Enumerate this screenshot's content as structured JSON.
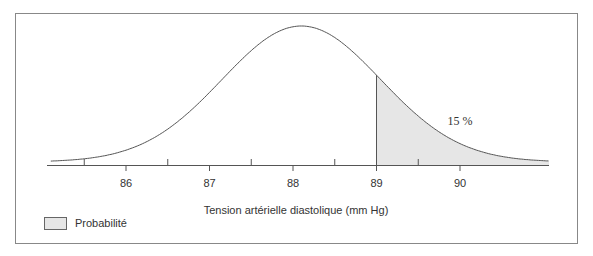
{
  "chart_data": {
    "type": "area",
    "title": "",
    "xlabel": "Tension artérielle diastolique (mm Hg)",
    "ylabel": "",
    "distribution": "normal",
    "mean": 88.1,
    "sd": 0.95,
    "xlim": [
      85.1,
      91.1
    ],
    "major_ticks": [
      86,
      87,
      88,
      89,
      90
    ],
    "minor_ticks": [
      85.5,
      86.5,
      87.5,
      88.5,
      89.5
    ],
    "tick_labels": [
      "86",
      "87",
      "88",
      "89",
      "90"
    ],
    "shaded_region": {
      "from": 89,
      "to": 91.1,
      "label": "15 %",
      "probability": 0.15
    },
    "legend": [
      {
        "label": "Probabilité",
        "color": "#e6e6e6"
      }
    ],
    "grid": false,
    "legend_position": "bottom-left"
  },
  "colors": {
    "frame": "#888888",
    "curve": "#555555",
    "shade": "#e6e6e6",
    "text": "#333333"
  }
}
